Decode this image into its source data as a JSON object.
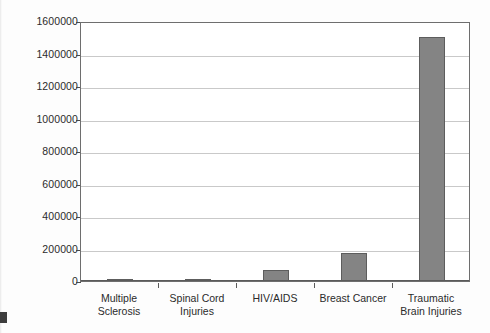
{
  "chart_data": {
    "type": "bar",
    "title": "",
    "subtitle": "",
    "xlabel": "",
    "ylabel": "",
    "categories": [
      "Multiple Sclerosis",
      "Spinal Cord Injuries",
      "HIV/AIDS",
      "Breast Cancer",
      "Traumatic Brain Injuries"
    ],
    "category_lines": [
      [
        "Multiple",
        "Sclerosis"
      ],
      [
        "Spinal Cord",
        "Injuries"
      ],
      [
        "HIV/AIDS"
      ],
      [
        "Breast Cancer"
      ],
      [
        "Traumatic",
        "Brain Injuries"
      ]
    ],
    "values": [
      15000,
      15000,
      70000,
      175000,
      1500000
    ],
    "ylim": [
      0,
      1600000
    ],
    "ytick_values": [
      0,
      200000,
      400000,
      600000,
      800000,
      1000000,
      1200000,
      1400000,
      1600000
    ],
    "ytick_labels": [
      "0",
      "200000",
      "400000",
      "600000",
      "800000",
      "1000000",
      "1200000",
      "1400000",
      "1600000"
    ],
    "grid": true,
    "legend": false,
    "legend_position": "none",
    "bar_color": "#848484",
    "bar_border_color": "#5d5d5d",
    "gridline_color": "#c9c9c9",
    "axis_color": "#4a4a4a",
    "plot_background": "#ffffff",
    "page_background": "#fdfdfd",
    "text_color": "#2b2b2b"
  }
}
